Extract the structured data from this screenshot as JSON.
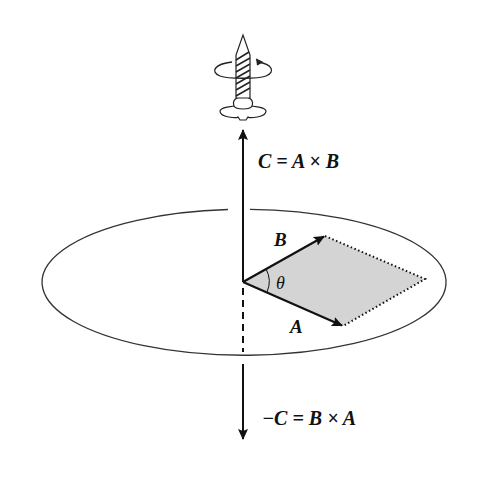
{
  "diagram": {
    "labels": {
      "c_equation": "C = A × B",
      "neg_c_equation": "−C = B × A",
      "vector_a": "A",
      "vector_b": "B",
      "angle": "θ"
    },
    "elements": [
      "screw with rotation arrow",
      "plane ellipse",
      "vector A",
      "vector B",
      "parallelogram spanned by A and B (shaded)",
      "vector C upward",
      "vector −C downward"
    ],
    "colors": {
      "line": "#111111",
      "parallelogram_fill": "#d4d4d4"
    }
  }
}
